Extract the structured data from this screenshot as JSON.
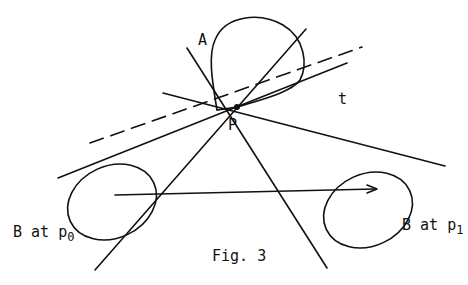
{
  "figure": {
    "caption": "Fig. 3",
    "labels": {
      "A": "A",
      "P": "P",
      "t": "t",
      "B0_prefix": "B at p",
      "B0_sub": "0",
      "B1_prefix": "B at p",
      "B1_sub": "1"
    },
    "colors": {
      "stroke": "#111111",
      "background": "#ffffff"
    }
  }
}
